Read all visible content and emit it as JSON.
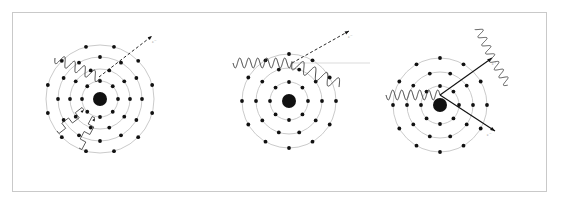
{
  "figure": {
    "frame": {
      "x": 12,
      "y": 12,
      "width": 535,
      "height": 180,
      "border_color": "#c9c9c9",
      "background_color": "#ffffff"
    },
    "colors": {
      "orbit_ring": "#bdbdbd",
      "electron": "#111111",
      "nucleus": "#111111",
      "photon_wave": "#333333",
      "trajectory": "#111111",
      "label_text": "#9a9a9a",
      "frame": "#c9c9c9",
      "background": "#ffffff"
    },
    "panels": [
      {
        "id": "photoelectric-effect",
        "name": "Photoelectric effect",
        "center": {
          "x": 100,
          "y": 99
        },
        "nucleus_radius": 7,
        "orbits": [
          {
            "radius": 18,
            "electron_count": 8
          },
          {
            "radius": 30,
            "electron_count": 10
          },
          {
            "radius": 42,
            "electron_count": 12
          },
          {
            "radius": 54,
            "electron_count": 12
          }
        ],
        "incoming_photon": {
          "type": "wavy",
          "label": "",
          "start": {
            "x": 55,
            "y": 58
          },
          "end": {
            "x": 100,
            "y": 78
          },
          "amplitude": 5,
          "wavelength": 11
        },
        "ejected_particle": {
          "type": "dashed-arrow",
          "label": "e⁻",
          "start": {
            "x": 99,
            "y": 77
          },
          "end": {
            "x": 152,
            "y": 36
          }
        },
        "secondary_emissions": [
          {
            "type": "zigzag",
            "label": "",
            "start": {
              "x": 84,
              "y": 110
            },
            "end": {
              "x": 57,
              "y": 131
            }
          },
          {
            "type": "zigzag",
            "label": "",
            "start": {
              "x": 95,
              "y": 118
            },
            "end": {
              "x": 79,
              "y": 148
            }
          }
        ]
      },
      {
        "id": "compton-scattering",
        "name": "Compton scattering",
        "center": {
          "x": 289,
          "y": 101
        },
        "nucleus_radius": 7,
        "orbits": [
          {
            "radius": 19,
            "electron_count": 8
          },
          {
            "radius": 33,
            "electron_count": 10
          },
          {
            "radius": 47,
            "electron_count": 12
          }
        ],
        "incoming_photon": {
          "type": "wavy",
          "label": "",
          "start": {
            "x": 233,
            "y": 63
          },
          "end": {
            "x": 292,
            "y": 63
          },
          "amplitude": 5,
          "wavelength": 9
        },
        "scattered_photon": {
          "type": "wavy",
          "label": "",
          "start": {
            "x": 292,
            "y": 63
          },
          "end": {
            "x": 340,
            "y": 85
          },
          "amplitude": 6,
          "wavelength": 13
        },
        "reference_axis": {
          "type": "line",
          "start": {
            "x": 292,
            "y": 63
          },
          "end": {
            "x": 370,
            "y": 63
          }
        },
        "ejected_particle": {
          "type": "dashed-arrow",
          "label": "e⁻",
          "start": {
            "x": 292,
            "y": 63
          },
          "end": {
            "x": 349,
            "y": 31
          }
        }
      },
      {
        "id": "pair-production",
        "name": "Pair production",
        "center": {
          "x": 440,
          "y": 105
        },
        "nucleus_radius": 7,
        "orbits": [
          {
            "radius": 19,
            "electron_count": 8
          },
          {
            "radius": 33,
            "electron_count": 10
          },
          {
            "radius": 47,
            "electron_count": 12
          }
        ],
        "incoming_photon": {
          "type": "wavy",
          "label": "",
          "start": {
            "x": 386,
            "y": 95
          },
          "end": {
            "x": 440,
            "y": 95
          },
          "amplitude": 5,
          "wavelength": 9
        },
        "pair": [
          {
            "type": "arrow",
            "label": "e⁺",
            "start": {
              "x": 440,
              "y": 95
            },
            "end": {
              "x": 492,
              "y": 58
            }
          },
          {
            "type": "arrow",
            "label": "e⁻",
            "start": {
              "x": 440,
              "y": 95
            },
            "end": {
              "x": 495,
              "y": 131
            }
          }
        ],
        "annihilation_photons": [
          {
            "type": "wavy",
            "start": {
              "x": 492,
              "y": 58
            },
            "end": {
              "x": 478,
              "y": 28
            },
            "amplitude": 4,
            "wavelength": 9
          },
          {
            "type": "wavy",
            "start": {
              "x": 492,
              "y": 58
            },
            "end": {
              "x": 508,
              "y": 85
            },
            "amplitude": 4,
            "wavelength": 9
          }
        ]
      }
    ]
  }
}
